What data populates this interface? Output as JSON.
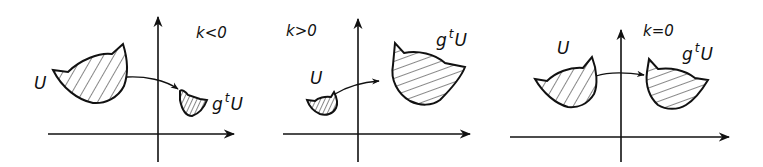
{
  "figure": {
    "panels": [
      {
        "id": "k-negative",
        "condition": "k<0",
        "source_label": "U",
        "image_label": {
          "g": "g",
          "t": "t",
          "U": "U"
        },
        "description": "Large hatched set U maps to a smaller set g^tU (contraction)"
      },
      {
        "id": "k-positive",
        "condition": "k>0",
        "source_label": "U",
        "image_label": {
          "g": "g",
          "t": "t",
          "U": "U"
        },
        "description": "Small hatched set U maps to a larger set g^tU (expansion)"
      },
      {
        "id": "k-zero",
        "condition": "k=0",
        "source_label": "U",
        "image_label": {
          "g": "g",
          "t": "t",
          "U": "U"
        },
        "description": "Hatched set U maps to a set g^tU of equal area"
      }
    ],
    "colors": {
      "ink": "#111111",
      "background": "#ffffff"
    }
  }
}
